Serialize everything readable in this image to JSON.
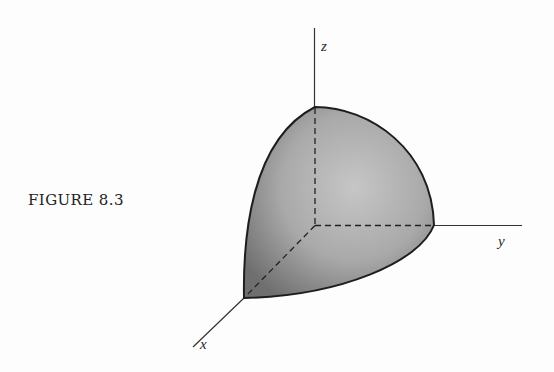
{
  "figure": {
    "caption": "FIGURE 8.3",
    "axes": {
      "x": {
        "label": "x"
      },
      "y": {
        "label": "y"
      },
      "z": {
        "label": "z"
      }
    },
    "colors": {
      "stroke": "#1e1e1e",
      "axis": "#333333",
      "shade_light": "#c4c4c4",
      "shade_dark": "#6e6e6e"
    }
  }
}
